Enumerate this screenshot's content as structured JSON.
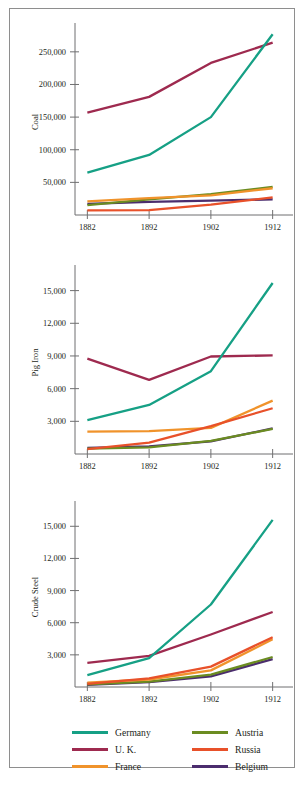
{
  "figure": {
    "border_color": "#8e8e8e",
    "background": "#ffffff"
  },
  "legend": {
    "columns": [
      {
        "items": [
          {
            "label": "Germany",
            "color": "#16a085"
          },
          {
            "label": "U. K.",
            "color": "#9e2a4f"
          },
          {
            "label": "France",
            "color": "#f0932b"
          }
        ]
      },
      {
        "items": [
          {
            "label": "Austria",
            "color": "#6b8c21"
          },
          {
            "label": "Russia",
            "color": "#e8512a"
          },
          {
            "label": "Belgium",
            "color": "#4b2d6e"
          }
        ]
      }
    ]
  },
  "chart_data": [
    {
      "type": "line",
      "title": "Coal",
      "ylabel": "Coal",
      "xlabel": "",
      "x": [
        1882,
        1892,
        1902,
        1912
      ],
      "xtick_labels": [
        "1882",
        "1892",
        "1902",
        "1912"
      ],
      "ytick_labels": [
        "50,000",
        "100,000",
        "150,000",
        "200,000",
        "250,000"
      ],
      "yticks": [
        50000,
        100000,
        150000,
        200000,
        250000
      ],
      "ylim": [
        0,
        285000
      ],
      "xlim": [
        1880,
        1914
      ],
      "grid": false,
      "legend_position": "bottom",
      "series": [
        {
          "name": "Germany",
          "color": "#16a085",
          "values": [
            65000,
            92000,
            150000,
            277000
          ]
        },
        {
          "name": "U. K.",
          "color": "#9e2a4f",
          "values": [
            157000,
            181000,
            233000,
            264000
          ]
        },
        {
          "name": "France",
          "color": "#f0932b",
          "values": [
            21000,
            26000,
            30000,
            41000
          ]
        },
        {
          "name": "Austria",
          "color": "#6b8c21",
          "values": [
            15000,
            24000,
            32000,
            43000
          ]
        },
        {
          "name": "Russia",
          "color": "#e8512a",
          "values": [
            7000,
            7500,
            16000,
            27000
          ]
        },
        {
          "name": "Belgium",
          "color": "#4b2d6e",
          "values": [
            17000,
            20000,
            22000,
            24000
          ]
        }
      ]
    },
    {
      "type": "line",
      "title": "Pig Iron",
      "ylabel": "Pig Iron",
      "xlabel": "",
      "x": [
        1882,
        1892,
        1902,
        1912
      ],
      "xtick_labels": [
        "1882",
        "1892",
        "1902",
        "1912"
      ],
      "ytick_labels": [
        "3,000",
        "6,000",
        "9,000",
        "12,000",
        "15,000"
      ],
      "yticks": [
        3000,
        6000,
        9000,
        12000,
        15000
      ],
      "ylim": [
        0,
        16800
      ],
      "xlim": [
        1880,
        1914
      ],
      "grid": false,
      "legend_position": "bottom",
      "series": [
        {
          "name": "Germany",
          "color": "#16a085",
          "values": [
            3100,
            4500,
            7600,
            15700
          ]
        },
        {
          "name": "U. K.",
          "color": "#9e2a4f",
          "values": [
            8750,
            6800,
            8950,
            9050
          ]
        },
        {
          "name": "France",
          "color": "#f0932b",
          "values": [
            2050,
            2100,
            2400,
            4900
          ]
        },
        {
          "name": "Austria",
          "color": "#6b8c21",
          "values": [
            500,
            600,
            1200,
            2300
          ]
        },
        {
          "name": "Russia",
          "color": "#e8512a",
          "values": [
            450,
            1050,
            2550,
            4200
          ]
        },
        {
          "name": "Belgium",
          "color": "#4b2d6e",
          "values": [
            550,
            700,
            1150,
            2350
          ]
        }
      ]
    },
    {
      "type": "line",
      "title": "Crude Steel",
      "ylabel": "Crude Steel",
      "xlabel": "",
      "x": [
        1882,
        1892,
        1902,
        1912
      ],
      "xtick_labels": [
        "1882",
        "1892",
        "1902",
        "1912"
      ],
      "ytick_labels": [
        "3,000",
        "6,000",
        "9,000",
        "12,000",
        "15,000"
      ],
      "yticks": [
        3000,
        6000,
        9000,
        12000,
        15000
      ],
      "ylim": [
        0,
        16800
      ],
      "xlim": [
        1880,
        1914
      ],
      "grid": false,
      "legend_position": "bottom",
      "series": [
        {
          "name": "Germany",
          "color": "#16a085",
          "values": [
            1100,
            2700,
            7700,
            15600
          ]
        },
        {
          "name": "U. K.",
          "color": "#9e2a4f",
          "values": [
            2250,
            2900,
            4900,
            7000
          ]
        },
        {
          "name": "France",
          "color": "#f0932b",
          "values": [
            400,
            700,
            1550,
            4450
          ]
        },
        {
          "name": "Austria",
          "color": "#6b8c21",
          "values": [
            250,
            500,
            1150,
            2800
          ]
        },
        {
          "name": "Russia",
          "color": "#e8512a",
          "values": [
            300,
            800,
            1900,
            4650
          ]
        },
        {
          "name": "Belgium",
          "color": "#4b2d6e",
          "values": [
            200,
            450,
            1000,
            2600
          ]
        }
      ]
    }
  ]
}
